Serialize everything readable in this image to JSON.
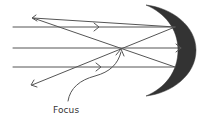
{
  "diagram": {
    "labels": {
      "focus": "Focus"
    },
    "colors": {
      "ray": "#555555",
      "mirror": "#333333",
      "text": "#333333",
      "background": "#ffffff"
    },
    "elements": {
      "incident_rays": 3,
      "reflected_rays": 2,
      "mirror_type": "concave"
    }
  }
}
